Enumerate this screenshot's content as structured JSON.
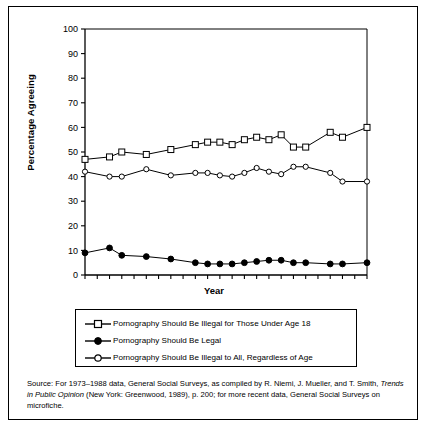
{
  "figure": {
    "ylabel": "Percentage Agreeing",
    "xlabel": "Year"
  },
  "legend": {
    "items": [
      {
        "marker": "open-square",
        "label": "Pornography Should Be Illegal for Those Under Age 18"
      },
      {
        "marker": "filled-circle",
        "label": "Pornography Should Be Legal"
      },
      {
        "marker": "open-diamond",
        "label": "Pornography Should Be Illegal to All, Regardless of Age"
      }
    ]
  },
  "source": {
    "part1": "Source: For 1973–1988 data, General Social Surveys, as compiled by R. Niemi, J. Mueller, and T. Smith, ",
    "italic": "Trends in Public Opinion",
    "part2": " (New York: Greenwood, 1989), p. 200; for more recent data, General Social Surveys on microfiche."
  },
  "chart_data": {
    "type": "line",
    "title": "",
    "xlabel": "Year",
    "ylabel": "Percentage Agreeing",
    "xlim": [
      1973,
      1996
    ],
    "ylim": [
      0,
      100
    ],
    "yticks": [
      0,
      10,
      20,
      30,
      40,
      50,
      60,
      70,
      80,
      90,
      100
    ],
    "xticks": [
      1973,
      1974,
      1975,
      1976,
      1977,
      1978,
      1979,
      1980,
      1981,
      1982,
      1983,
      1984,
      1985,
      1986,
      1987,
      1988,
      1989,
      1990,
      1991,
      1992,
      1993,
      1994,
      1995,
      1996
    ],
    "xtick_labels": [
      "1973",
      "",
      "1975",
      "",
      "1977",
      "",
      "1979",
      "",
      "1981",
      "",
      "1983",
      "",
      "1985",
      "",
      "1987",
      "",
      "1989",
      "",
      "1991",
      "",
      "1993",
      "",
      "1995",
      ""
    ],
    "grid": false,
    "legend_position": "below",
    "x": [
      1973,
      1975,
      1976,
      1978,
      1980,
      1982,
      1983,
      1984,
      1985,
      1986,
      1987,
      1988,
      1989,
      1990,
      1991,
      1993,
      1994,
      1996
    ],
    "series": [
      {
        "name": "Pornography Should Be Illegal for Those Under Age 18",
        "marker": "open-square",
        "x": [
          1973,
          1975,
          1976,
          1978,
          1980,
          1982,
          1983,
          1984,
          1985,
          1986,
          1987,
          1988,
          1989,
          1990,
          1991,
          1993,
          1994,
          1996
        ],
        "values": [
          47,
          48,
          50,
          49,
          51,
          53,
          54,
          54,
          53,
          55,
          56,
          55,
          57,
          52,
          52,
          58,
          56,
          60
        ]
      },
      {
        "name": "Pornography Should Be Legal",
        "marker": "filled-circle",
        "x": [
          1973,
          1975,
          1976,
          1978,
          1980,
          1982,
          1983,
          1984,
          1985,
          1986,
          1987,
          1988,
          1989,
          1990,
          1991,
          1993,
          1994,
          1996
        ],
        "values": [
          9,
          11,
          8,
          7.5,
          6.5,
          5,
          4.5,
          4.5,
          4.5,
          5,
          5.5,
          6,
          6,
          5,
          5,
          4.5,
          4.5,
          5
        ]
      },
      {
        "name": "Pornography Should Be Illegal to All, Regardless of Age",
        "marker": "open-diamond",
        "x": [
          1973,
          1975,
          1976,
          1978,
          1980,
          1982,
          1983,
          1984,
          1985,
          1986,
          1987,
          1988,
          1989,
          1990,
          1991,
          1993,
          1994,
          1996
        ],
        "values": [
          42,
          40,
          40,
          43,
          40.5,
          41.5,
          41.5,
          40.5,
          40,
          41.5,
          43.5,
          42,
          41,
          44,
          44,
          41.5,
          38,
          38
        ]
      }
    ]
  }
}
